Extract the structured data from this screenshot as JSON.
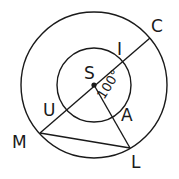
{
  "diagram": {
    "type": "geometry-concentric-circles",
    "center": {
      "label": "S",
      "x": 94,
      "y": 85
    },
    "outer_circle": {
      "cx": 94,
      "cy": 85,
      "r": 73
    },
    "inner_circle": {
      "cx": 94,
      "cy": 85,
      "r": 37
    },
    "points": {
      "C": {
        "x": 150,
        "y": 38
      },
      "I": {
        "x": 123,
        "y": 61
      },
      "U": {
        "x": 66,
        "y": 108
      },
      "M": {
        "x": 40,
        "y": 133
      },
      "A": {
        "x": 113,
        "y": 117
      },
      "L": {
        "x": 130,
        "y": 148
      }
    },
    "segments": [
      {
        "from": "M",
        "to": "C"
      },
      {
        "from": "S",
        "to": "L"
      },
      {
        "from": "M",
        "to": "L"
      }
    ],
    "labels": {
      "S": "S",
      "C": "C",
      "I": "I",
      "U": "U",
      "M": "M",
      "A": "A",
      "L": "L",
      "angle": "100°"
    },
    "angle_annotation": {
      "vertex": "S",
      "between": [
        "I",
        "A"
      ],
      "value": "100°"
    },
    "colors": {
      "stroke": "#1a1a1a",
      "background": "#ffffff"
    }
  }
}
